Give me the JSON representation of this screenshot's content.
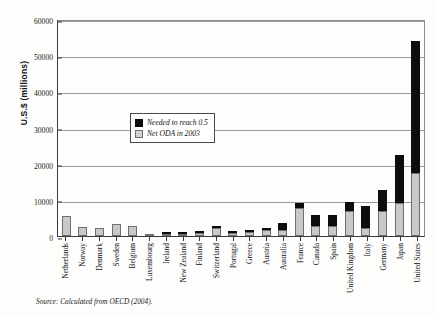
{
  "chart_data": {
    "type": "bar",
    "subtype": "stacked-vertical",
    "title": "",
    "xlabel": "",
    "ylabel": "U.S.$ (millions)",
    "ylim": [
      0,
      60000
    ],
    "yticks": [
      0,
      10000,
      20000,
      30000,
      40000,
      50000,
      60000
    ],
    "ytick_labels": [
      "0",
      "10000",
      "20000",
      "30000",
      "40000",
      "50000",
      "60000"
    ],
    "grid": true,
    "legend_position": "upper-left-inside",
    "categories": [
      "Netherlands",
      "Norway",
      "Denmark",
      "Sweden",
      "Belgium",
      "Luxembourg",
      "Ireland",
      "New Zealand",
      "Finland",
      "Switzerland",
      "Portugal",
      "Greece",
      "Austria",
      "Australia",
      "France",
      "Canada",
      "Spain",
      "United Kingdom",
      "Italy",
      "Germany",
      "Japan",
      "United States"
    ],
    "series": [
      {
        "name": "Net ODA in 2003",
        "color": "#c9c9c9",
        "values": [
          5600,
          2500,
          2350,
          3300,
          2700,
          180,
          400,
          180,
          900,
          2100,
          800,
          1000,
          1600,
          1600,
          7700,
          2850,
          2700,
          7000,
          2250,
          7000,
          9000,
          17500
        ]
      },
      {
        "name": "Needed to reach 0.5",
        "color": "#0d0d0d",
        "values": [
          0,
          0,
          0,
          0,
          0,
          0,
          100,
          80,
          150,
          200,
          100,
          150,
          250,
          2000,
          1500,
          3000,
          3100,
          2500,
          5950,
          5800,
          13500,
          36500
        ]
      }
    ],
    "totals": [
      5600,
      2500,
      2350,
      3300,
      2700,
      180,
      500,
      260,
      1050,
      2300,
      900,
      1150,
      1850,
      3600,
      9200,
      5850,
      5800,
      9500,
      8200,
      12800,
      22500,
      54000
    ]
  },
  "legend": {
    "items": [
      {
        "label": "Needed to reach 0.5",
        "swatch": "black"
      },
      {
        "label": "Net ODA in 2003",
        "swatch": "gray"
      }
    ]
  },
  "source": "Source: Calculated from OECD (2004)."
}
